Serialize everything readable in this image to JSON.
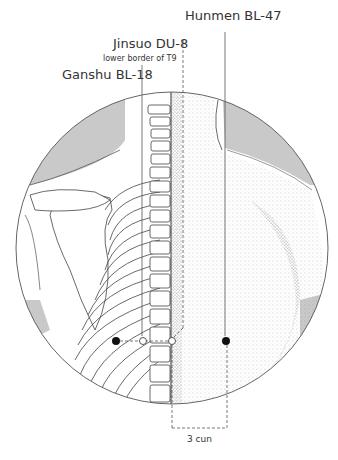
{
  "figure": {
    "type": "acupuncture-point-diagram",
    "region": "upper back / thoracic spine"
  },
  "labels": {
    "hunmen": {
      "name": "Hunmen BL-47"
    },
    "jinsuo": {
      "name": "Jinsuo DU-8",
      "note": "lower border of T9"
    },
    "ganshu": {
      "name": "Ganshu BL-18"
    },
    "measure": "3 cun"
  },
  "points": [
    {
      "id": "ganshu-left",
      "style": "filled",
      "x": 116,
      "y": 341
    },
    {
      "id": "ganshu-right",
      "style": "open",
      "x": 143,
      "y": 341
    },
    {
      "id": "jinsuo",
      "style": "open",
      "x": 172,
      "y": 341
    },
    {
      "id": "hunmen",
      "style": "filled",
      "x": 226,
      "y": 341
    }
  ],
  "colors": {
    "line": "#555555",
    "shade": "#c8c8c8",
    "point": "#111111"
  }
}
